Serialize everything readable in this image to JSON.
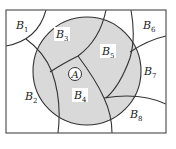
{
  "diagram": {
    "type": "set-partition-venn",
    "universe": {
      "shape": "rectangle"
    },
    "event": {
      "label": "A",
      "shape": "circle",
      "fill": "#d9d9d9"
    },
    "partition": [
      {
        "id": "B1",
        "label": "B",
        "sub": "1"
      },
      {
        "id": "B2",
        "label": "B",
        "sub": "2"
      },
      {
        "id": "B3",
        "label": "B",
        "sub": "3"
      },
      {
        "id": "B4",
        "label": "B",
        "sub": "4"
      },
      {
        "id": "B5",
        "label": "B",
        "sub": "5"
      },
      {
        "id": "B6",
        "label": "B",
        "sub": "6"
      },
      {
        "id": "B7",
        "label": "B",
        "sub": "7"
      },
      {
        "id": "B8",
        "label": "B",
        "sub": "8"
      }
    ],
    "colors": {
      "line": "#333333",
      "shade": "#d9d9d9",
      "background": "#ffffff"
    }
  }
}
